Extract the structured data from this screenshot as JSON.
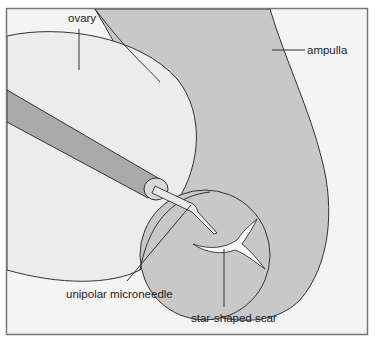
{
  "diagram": {
    "labels": {
      "ovary": "ovary",
      "ampulla": "ampulla",
      "needle": "unipolar microneedle",
      "scar": "star-shaped scar"
    },
    "colors": {
      "background": "#f4f4f4",
      "frame": "#777777",
      "ovary_fill": "#ececec",
      "ampulla_fill": "#c8c8c8",
      "probe_fill": "#aaaaaa",
      "outline": "#333333",
      "scar_fill": "#f7f7f7"
    }
  }
}
